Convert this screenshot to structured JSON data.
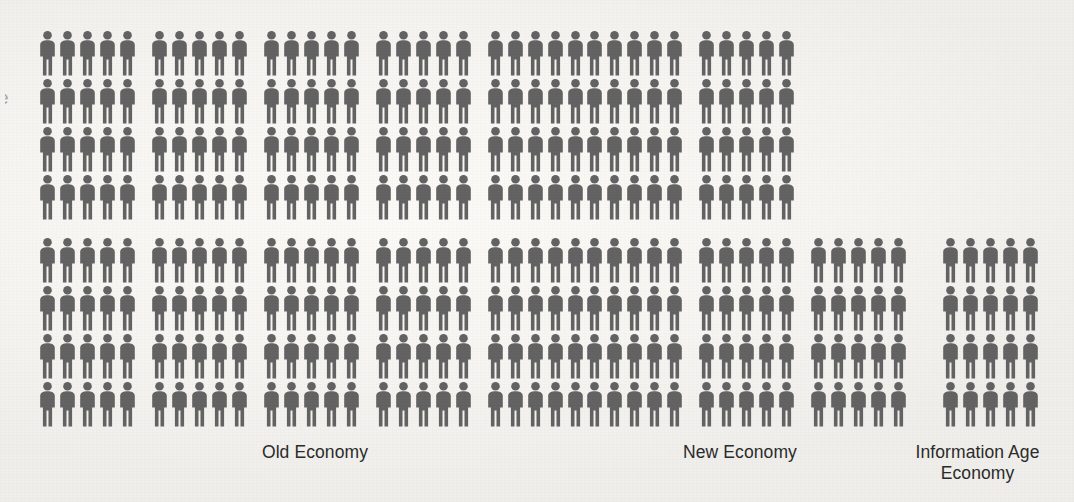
{
  "chart_data": {
    "type": "pictogram",
    "title": "",
    "xlabel": "",
    "ylabel": "",
    "unit_note": "each icon represents one worker unit",
    "icon": "person-icon",
    "icon_color": "#636363",
    "background_color": "#f7f6f2",
    "grid": false,
    "legend_position": "none",
    "rows_total": 8,
    "row_groups": [
      4,
      4
    ],
    "icons_per_block": 5,
    "categories": [
      "Old Economy",
      "New Economy",
      "Information Age Economy"
    ],
    "values": [
      200,
      100,
      20
    ],
    "series": [
      {
        "name": "Old Economy",
        "total_icons": 200,
        "blocks_per_row_top": 5,
        "blocks_per_row_bottom": 5,
        "icons_per_row_top": 25,
        "icons_per_row_bottom": 25,
        "rows_top": 4,
        "rows_bottom": 4
      },
      {
        "name": "New Economy",
        "total_icons": 100,
        "blocks_per_row_top": 2,
        "blocks_per_row_bottom": 3,
        "icons_per_row_top": 10,
        "icons_per_row_bottom": 15,
        "rows_top": 4,
        "rows_bottom": 4
      },
      {
        "name": "Information Age Economy",
        "total_icons": 20,
        "blocks_per_row_top": 0,
        "blocks_per_row_bottom": 1,
        "icons_per_row_top": 0,
        "icons_per_row_bottom": 5,
        "rows_top": 0,
        "rows_bottom": 4
      }
    ]
  },
  "labels": {
    "old_economy": "Old Economy",
    "new_economy": "New Economy",
    "information_age_economy": "Information Age\nEconomy"
  },
  "artifact": {
    "edge_mark": "e"
  }
}
